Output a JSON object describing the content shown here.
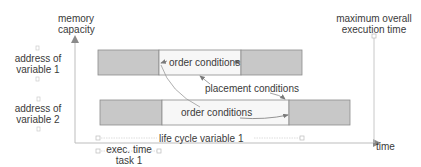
{
  "axes": {
    "y_label_line1": "memory",
    "y_label_line2": "capacity",
    "x_label": "time"
  },
  "rows": [
    {
      "label_line1": "address of",
      "label_line2": "variable 1",
      "middle_text": "order conditions"
    },
    {
      "label_line1": "address of",
      "label_line2": "variable 2",
      "middle_text": "order conditions"
    }
  ],
  "annotations": {
    "placement": "placement conditions",
    "max_time_line1": "maximum overall",
    "max_time_line2": "execution time",
    "lifecycle": "life cycle variable 1",
    "exec_line1": "exec. time",
    "exec_line2": "task 1"
  },
  "colors": {
    "gray_block": "#c8c8c8",
    "white_block": "#f7f7f7",
    "axis": "#bdbdbd",
    "arrow": "#8a8a8a",
    "border": "#8c8c8c"
  }
}
